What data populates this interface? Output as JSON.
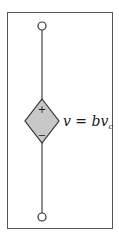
{
  "diagram": {
    "type": "circuit-element",
    "element": "voltage-controlled voltage source (dependent source)",
    "source": {
      "shape": "diamond",
      "fill_color": "#c8c8c8",
      "stroke_color": "#333333",
      "polarity_top": "+",
      "polarity_bottom": "−"
    },
    "label": {
      "lhs": "v",
      "equals": " = ",
      "coefficient": "b",
      "var": "v",
      "subscript": "c"
    },
    "terminals": [
      "top",
      "bottom"
    ],
    "frame_color": "#555555",
    "wire_color": "#444444"
  }
}
